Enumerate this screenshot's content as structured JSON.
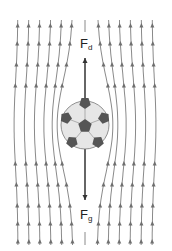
{
  "diagram": {
    "title": "",
    "labels": {
      "drag_force": {
        "main": "F",
        "sub": "d"
      },
      "gravity_force": {
        "main": "F",
        "sub": "g"
      }
    },
    "objects": {
      "ball": "soccer-ball",
      "flow": "upward-streamlines"
    },
    "colors": {
      "streamline": "#8a8a8a",
      "arrow": "#333333",
      "ball_fill": "#e6e6e6",
      "ball_patch": "#555555"
    },
    "streamline_count": 13
  }
}
